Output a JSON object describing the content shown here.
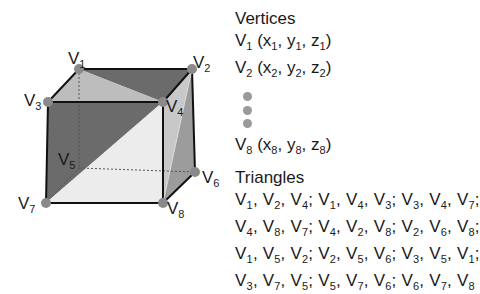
{
  "diagram": {
    "type": "cube-mesh-triangulation",
    "colors": {
      "edge": "#111111",
      "dark_face": "#6b6b6b",
      "light_face": "#bdbdbd",
      "lighter_face": "#ececec",
      "mid_face": "#9c9c9c",
      "vertex_dot": "#8a8a8a",
      "hidden_edge": "#555555"
    },
    "vertices": [
      {
        "id": "V1",
        "base": "V",
        "sub": "1",
        "x": 79,
        "y": 69
      },
      {
        "id": "V2",
        "base": "V",
        "sub": "2",
        "x": 192,
        "y": 69
      },
      {
        "id": "V3",
        "base": "V",
        "sub": "3",
        "x": 48,
        "y": 102
      },
      {
        "id": "V4",
        "base": "V",
        "sub": "4",
        "x": 163,
        "y": 102
      },
      {
        "id": "V5",
        "base": "V",
        "sub": "5",
        "x": 79,
        "y": 168
      },
      {
        "id": "V6",
        "base": "V",
        "sub": "6",
        "x": 195,
        "y": 172
      },
      {
        "id": "V7",
        "base": "V",
        "sub": "7",
        "x": 46,
        "y": 203
      },
      {
        "id": "V8",
        "base": "V",
        "sub": "8",
        "x": 163,
        "y": 203
      }
    ]
  },
  "vertices_panel": {
    "heading": "Vertices",
    "items": [
      {
        "v": "V",
        "vs": "1",
        "x": "x",
        "xs": "1",
        "y": "y",
        "ys": "1",
        "z": "z",
        "zs": "1"
      },
      {
        "v": "V",
        "vs": "2",
        "x": "x",
        "xs": "2",
        "y": "y",
        "ys": "2",
        "z": "z",
        "zs": "2"
      },
      {
        "v": "V",
        "vs": "8",
        "x": "x",
        "xs": "8",
        "y": "y",
        "ys": "8",
        "z": "z",
        "zs": "8"
      }
    ],
    "ellipsis_dots": 3
  },
  "triangles_panel": {
    "heading": "Triangles",
    "rows": [
      [
        [
          "1",
          "2",
          "4"
        ],
        [
          "1",
          "4",
          "3"
        ],
        [
          "3",
          "4",
          "7"
        ]
      ],
      [
        [
          "4",
          "8",
          "7"
        ],
        [
          "4",
          "2",
          "8"
        ],
        [
          "2",
          "6",
          "8"
        ]
      ],
      [
        [
          "1",
          "5",
          "2"
        ],
        [
          "2",
          "5",
          "6"
        ],
        [
          "3",
          "5",
          "1"
        ]
      ],
      [
        [
          "3",
          "7",
          "5"
        ],
        [
          "5",
          "7",
          "6"
        ],
        [
          "6",
          "7",
          "8"
        ]
      ]
    ],
    "vertex_letter": "V",
    "separator": ";",
    "comma": ","
  }
}
